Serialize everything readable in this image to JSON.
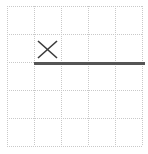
{
  "canvas": {
    "width": 148,
    "height": 154,
    "background": "#ffffff",
    "title": "grid-with-x-marker-and-line"
  },
  "grid": {
    "style": "dotted",
    "color": "#c9c9c9",
    "stroke_width": 1,
    "dash": "1,1",
    "columns": 5,
    "rows": 5,
    "x_positions": [
      7,
      34,
      61,
      88,
      115,
      142
    ],
    "y_positions": [
      6,
      34,
      62,
      90,
      118,
      146
    ],
    "cell_width": 27,
    "cell_height": 28
  },
  "marks": [
    {
      "name": "x-marker",
      "type": "x",
      "color": "#3a3a3a",
      "stroke_width": 1.6,
      "cell_row": 2,
      "cell_col": 2,
      "x1": 38,
      "y1": 41,
      "x2": 57,
      "y2": 58,
      "label": "X"
    },
    {
      "name": "horizontal-rule",
      "type": "line",
      "color": "#555555",
      "stroke_width": 3,
      "x1": 34,
      "y1": 63,
      "x2": 145,
      "y2": 63,
      "label": "thick horizontal line"
    }
  ]
}
